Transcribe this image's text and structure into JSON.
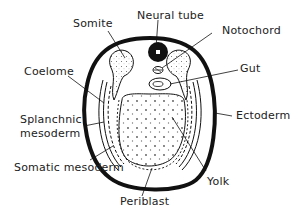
{
  "diagram": {
    "type": "labeled cross-section",
    "colors": {
      "ink": "#111111",
      "background": "#ffffff",
      "stipple": "#555555"
    },
    "labels": {
      "somite": "Somite",
      "neural_tube": "Neural tube",
      "notochord": "Notochord",
      "coelome": "Coelome",
      "gut": "Gut",
      "splanchnic_1": "Splanchnic",
      "splanchnic_2": "mesoderm",
      "ectoderm": "Ectoderm",
      "somatic": "Somatic mesoderm",
      "yolk": "Yolk",
      "periblast": "Periblast"
    }
  }
}
